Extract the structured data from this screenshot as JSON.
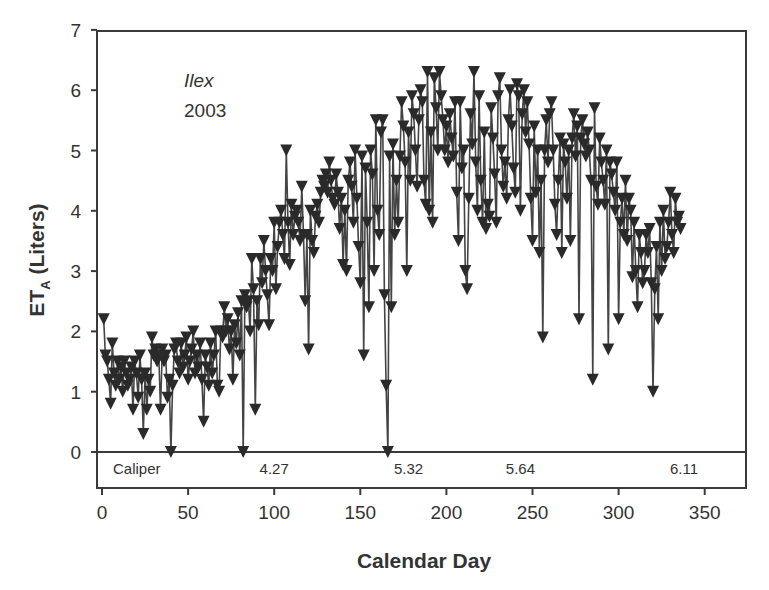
{
  "chart_data": {
    "type": "line",
    "title": "",
    "annotation": {
      "species": "Ilex",
      "year": "2003"
    },
    "xlabel": "Calendar Day",
    "ylabel": "ET",
    "ylabel_sub": "A",
    "ylabel_unit": " (Liters)",
    "xlim": [
      -2,
      375
    ],
    "ylim": [
      -0.6,
      7
    ],
    "xticks": [
      0,
      50,
      100,
      150,
      200,
      250,
      300,
      350
    ],
    "yticks": [
      0,
      1,
      2,
      3,
      4,
      5,
      6,
      7
    ],
    "marker": "triangle-down",
    "grid": false,
    "zero_line": true,
    "caliper_label": "Caliper",
    "caliper_values": [
      {
        "day": 100,
        "value": "4.27"
      },
      {
        "day": 178,
        "value": "5.32"
      },
      {
        "day": 243,
        "value": "5.64"
      },
      {
        "day": 338,
        "value": "6.11"
      }
    ],
    "series": [
      {
        "name": "ETA",
        "x_start": 1,
        "values": [
          2.2,
          1.6,
          1.5,
          1.2,
          0.8,
          1.8,
          1.3,
          1.1,
          1.5,
          1.2,
          1.4,
          1.0,
          1.5,
          1.3,
          1.1,
          1.2,
          1.4,
          0.7,
          1.5,
          1.3,
          0.9,
          1.6,
          1.2,
          0.3,
          1.3,
          0.7,
          1.2,
          1.0,
          1.9,
          1.6,
          1.7,
          1.5,
          1.6,
          0.7,
          1.7,
          1.5,
          1.6,
          0.9,
          1.2,
          0.0,
          1.1,
          1.7,
          1.8,
          1.5,
          1.3,
          1.8,
          1.4,
          1.6,
          1.9,
          1.2,
          1.5,
          1.7,
          2.0,
          1.3,
          1.6,
          1.4,
          1.8,
          1.2,
          0.5,
          1.6,
          1.4,
          1.1,
          1.8,
          1.3,
          1.6,
          2.0,
          1.1,
          1.0,
          2.0,
          1.9,
          2.4,
          2.0,
          2.2,
          1.7,
          2.0,
          1.2,
          2.1,
          1.8,
          2.3,
          1.6,
          2.5,
          0.0,
          2.6,
          2.4,
          2.5,
          2.0,
          3.2,
          2.7,
          0.7,
          2.5,
          2.1,
          3.2,
          2.8,
          3.5,
          3.0,
          2.6,
          2.1,
          3.2,
          3.0,
          3.8,
          2.7,
          3.4,
          3.8,
          4.0,
          3.6,
          3.2,
          5.0,
          3.8,
          3.1,
          4.1,
          3.6,
          3.9,
          4.0,
          3.8,
          3.5,
          4.4,
          3.6,
          2.5,
          3.6,
          1.7,
          4.0,
          3.5,
          3.3,
          3.9,
          4.1,
          3.8,
          4.3,
          4.5,
          4.4,
          4.6,
          4.3,
          4.8,
          4.5,
          4.2,
          4.1,
          4.6,
          4.3,
          3.7,
          4.2,
          3.1,
          4.0,
          3.0,
          4.5,
          4.8,
          4.4,
          3.8,
          5.0,
          4.2,
          3.4,
          2.8,
          4.9,
          1.6,
          4.7,
          3.8,
          2.4,
          5.0,
          4.6,
          3.0,
          5.5,
          4.0,
          3.6,
          5.3,
          5.5,
          2.6,
          1.1,
          0.0,
          4.9,
          2.4,
          5.1,
          3.6,
          4.5,
          3.8,
          4.9,
          5.8,
          5.4,
          4.8,
          3.0,
          5.3,
          4.5,
          5.9,
          5.6,
          5.0,
          4.4,
          5.5,
          6.0,
          5.8,
          4.5,
          4.1,
          6.3,
          4.0,
          5.3,
          3.8,
          6.2,
          5.7,
          5.0,
          6.3,
          5.9,
          5.5,
          5.0,
          5.4,
          4.8,
          5.6,
          5.2,
          4.9,
          5.8,
          4.3,
          3.5,
          5.8,
          4.7,
          5.0,
          3.0,
          2.7,
          4.2,
          5.6,
          5.1,
          6.3,
          4.8,
          4.0,
          5.9,
          4.5,
          3.8,
          5.3,
          3.7,
          4.1,
          3.9,
          5.7,
          5.2,
          4.6,
          3.8,
          5.9,
          6.2,
          5.0,
          4.4,
          4.8,
          4.2,
          5.5,
          6.0,
          5.4,
          4.7,
          4.3,
          6.1,
          5.9,
          4.0,
          5.6,
          6.0,
          5.3,
          5.8,
          5.1,
          4.2,
          3.5,
          5.4,
          4.3,
          5.0,
          3.3,
          4.5,
          1.9,
          5.0,
          5.5,
          4.8,
          5.6,
          5.8,
          5.0,
          4.1,
          3.6,
          4.5,
          5.2,
          3.3,
          5.1,
          4.8,
          4.2,
          5.0,
          3.5,
          5.2,
          5.6,
          4.9,
          5.4,
          2.2,
          5.2,
          5.5,
          5.1,
          4.9,
          5.3,
          5.0,
          4.5,
          1.2,
          5.7,
          4.4,
          4.1,
          5.2,
          4.8,
          4.5,
          4.1,
          5.0,
          1.7,
          4.8,
          4.6,
          4.3,
          4.0,
          4.8,
          2.2,
          3.8,
          4.2,
          3.6,
          4.5,
          3.5,
          4.2,
          4.0,
          2.9,
          3.8,
          3.0,
          2.4,
          3.6,
          3.3,
          2.8,
          3.0,
          3.6,
          3.3,
          3.7,
          2.8,
          1.0,
          2.7,
          3.4,
          2.2,
          3.8,
          3.0,
          4.0,
          3.2,
          3.4,
          3.8,
          4.3,
          3.6,
          3.3,
          4.2,
          3.8,
          3.9,
          3.7
        ]
      }
    ]
  }
}
